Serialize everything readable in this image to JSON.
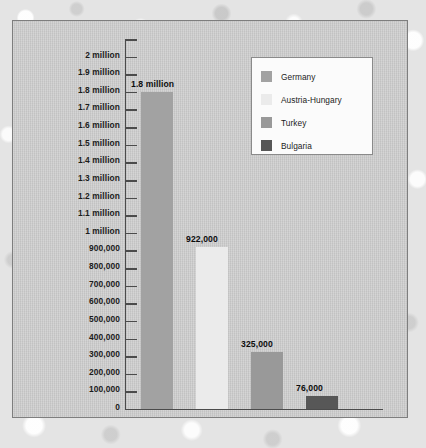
{
  "chart_data": {
    "type": "bar",
    "title": "",
    "subtitle": "",
    "xlabel": "",
    "ylabel": "",
    "categories": [
      "Germany",
      "Austria-Hungary",
      "Turkey",
      "Bulgaria"
    ],
    "values": [
      1800000,
      922000,
      325000,
      76000
    ],
    "value_labels": [
      "1.8 million",
      "922,000",
      "325,000",
      "76,000"
    ],
    "series": [
      {
        "name": "Central Powers casualties",
        "values": [
          1800000,
          922000,
          325000,
          76000
        ]
      }
    ],
    "ylim": [
      0,
      2100000
    ],
    "grid": false,
    "legend_position": "top-right",
    "ytick_values": [
      2000000,
      1900000,
      1800000,
      1700000,
      1600000,
      1500000,
      1400000,
      1300000,
      1200000,
      1100000,
      1000000,
      900000,
      800000,
      700000,
      600000,
      500000,
      400000,
      300000,
      200000,
      100000,
      0
    ],
    "ytick_labels": [
      "2 million",
      "1.9 million",
      "1.8 million",
      "1.7 million",
      "1.6 million",
      "1.5 million",
      "1.4 million",
      "1.3 million",
      "1.2 million",
      "1.1 million",
      "1 million",
      "900,000",
      "800,000",
      "700,000",
      "600,000",
      "500,000",
      "400,000",
      "300,000",
      "200,000",
      "100,000",
      "0"
    ],
    "unlabeled_top_tick_value": 2100000,
    "bar_colors": [
      "#a2a2a2",
      "#ebebeb",
      "#999999",
      "#575757"
    ]
  },
  "legend": {
    "items": [
      {
        "label": "Germany",
        "color": "#a2a2a2"
      },
      {
        "label": "Austria-Hungary",
        "color": "#ebebeb"
      },
      {
        "label": "Turkey",
        "color": "#999999"
      },
      {
        "label": "Bulgaria",
        "color": "#575757"
      }
    ]
  },
  "colors": {
    "panel_background": "#c9c9c9",
    "panel_border": "#7e7e7e",
    "page_background": "#e4e4e4",
    "axis": "#4b4b4b",
    "text": "#1c1c1c",
    "legend_background": "#fbfbfb",
    "legend_border": "#8a8a8a"
  }
}
